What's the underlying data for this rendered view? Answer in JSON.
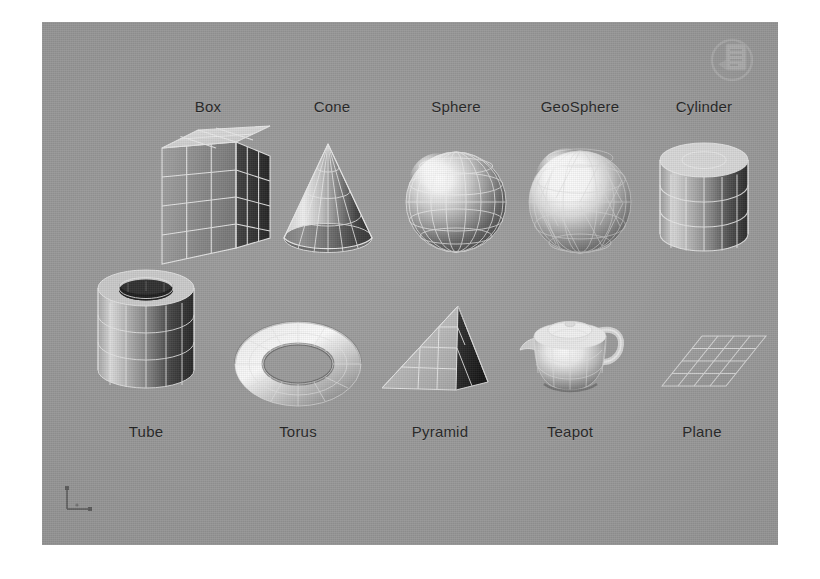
{
  "viewport": {
    "background_color": "#9a9a9a",
    "wire_color": "#e8e8e8",
    "label_color": "#1d1d1d",
    "page_background": "#ffffff"
  },
  "objects": {
    "top_row": [
      {
        "label": "Box",
        "icon": "box-primitive-icon",
        "label_position": "top"
      },
      {
        "label": "Cone",
        "icon": "cone-primitive-icon",
        "label_position": "top"
      },
      {
        "label": "Sphere",
        "icon": "sphere-primitive-icon",
        "label_position": "top"
      },
      {
        "label": "GeoSphere",
        "icon": "geosphere-primitive-icon",
        "label_position": "top"
      },
      {
        "label": "Cylinder",
        "icon": "cylinder-primitive-icon",
        "label_position": "top"
      }
    ],
    "bottom_row": [
      {
        "label": "Tube",
        "icon": "tube-primitive-icon",
        "label_position": "bottom"
      },
      {
        "label": "Torus",
        "icon": "torus-primitive-icon",
        "label_position": "bottom"
      },
      {
        "label": "Pyramid",
        "icon": "pyramid-primitive-icon",
        "label_position": "bottom"
      },
      {
        "label": "Teapot",
        "icon": "teapot-primitive-icon",
        "label_position": "bottom"
      },
      {
        "label": "Plane",
        "icon": "plane-primitive-icon",
        "label_position": "bottom"
      }
    ]
  },
  "overlays": {
    "axis_tripod": "axis-tripod-icon",
    "watermark": "document-watermark-icon"
  }
}
